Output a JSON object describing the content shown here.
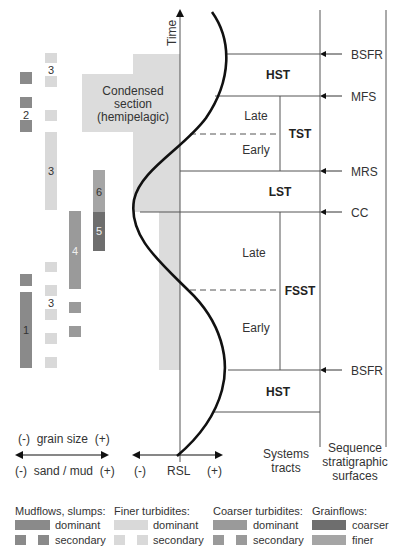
{
  "axis": {
    "time_label": "Time",
    "grain_size_label": "(-)  grain size  (+)",
    "sand_mud_label": "(-)  sand / mud  (+)",
    "rsl_minus": "(-)",
    "rsl_label": "RSL",
    "rsl_plus": "(+)"
  },
  "condensed_section": {
    "line1": "Condensed",
    "line2": "section",
    "line3": "(hemipelagic)"
  },
  "systems_tracts": {
    "hst_top": "HST",
    "tst": "TST",
    "tst_late": "Late",
    "tst_early": "Early",
    "lst": "LST",
    "fsst": "FSST",
    "fsst_late": "Late",
    "fsst_early": "Early",
    "hst_bottom": "HST"
  },
  "surfaces": {
    "bsfr_top": "BSFR",
    "mfs": "MFS",
    "mrs": "MRS",
    "cc": "CC",
    "bsfr_bottom": "BSFR"
  },
  "column_headers": {
    "systems_tracts_1": "Systems",
    "systems_tracts_2": "tracts",
    "surfaces_1": "Sequence",
    "surfaces_2": "stratigraphic",
    "surfaces_3": "surfaces"
  },
  "deposit_labels": {
    "l1": "1",
    "l2": "2",
    "l3a": "3",
    "l3b": "3",
    "l3c": "3",
    "l4": "4",
    "l5": "5",
    "l6": "6"
  },
  "legend": {
    "mudflows": {
      "title": "Mudflows, slumps:",
      "dominant": "dominant",
      "secondary": "secondary",
      "color": "#8a8a8a"
    },
    "finer": {
      "title": "Finer turbidites:",
      "dominant": "dominant",
      "secondary": "secondary",
      "color": "#d9d9d9"
    },
    "coarser": {
      "title": "Coarser turbidites:",
      "dominant": "dominant",
      "secondary": "secondary",
      "color": "#9a9a9a"
    },
    "grainflows": {
      "title": "Grainflows:",
      "coarser": "coarser",
      "finer": "finer",
      "coarser_color": "#6e6e6e",
      "finer_color": "#a5a5a5"
    }
  },
  "colors": {
    "condensed": "#dcdcdc",
    "line": "#555555",
    "curve": "#111111"
  }
}
